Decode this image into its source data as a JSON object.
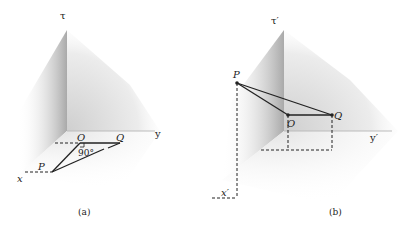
{
  "panel_a": {
    "caption": "(a)",
    "axis_time": "τ",
    "axis_y": "y",
    "axis_x": "x",
    "point_O": "O",
    "point_Q": "Q",
    "point_P": "P",
    "angle_label": "90°"
  },
  "panel_b": {
    "caption": "(b)",
    "axis_time": "τ′",
    "axis_y": "y′",
    "axis_x": "x′",
    "point_O": "O",
    "point_Q": "Q",
    "point_P": "P"
  }
}
